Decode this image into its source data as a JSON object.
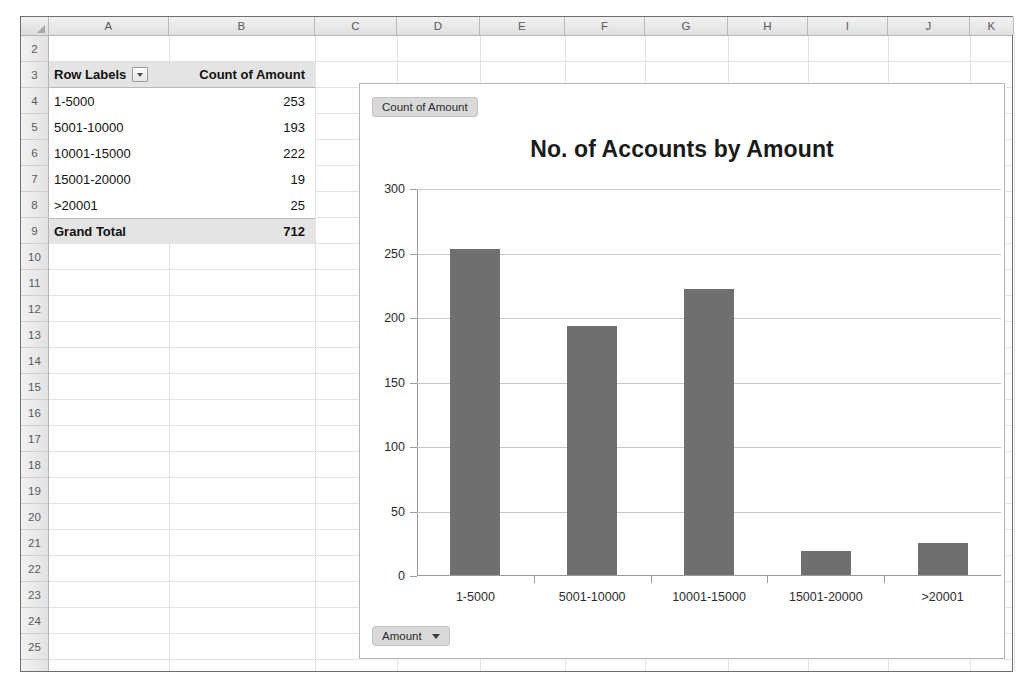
{
  "spreadsheet": {
    "corner_label": "select-all",
    "columns": [
      "A",
      "B",
      "C",
      "D",
      "E",
      "F",
      "G",
      "H",
      "I",
      "J",
      "K"
    ],
    "rows": [
      "2",
      "3",
      "4",
      "5",
      "6",
      "7",
      "8",
      "9",
      "10",
      "11",
      "12",
      "13",
      "14",
      "15",
      "16",
      "17",
      "18",
      "19",
      "20",
      "21",
      "22",
      "23",
      "24",
      "25"
    ],
    "pivot": {
      "header": {
        "row_labels": "Row Labels",
        "value_header": "Count of Amount"
      },
      "rows": [
        {
          "label": "1-5000",
          "count": "253"
        },
        {
          "label": "5001-10000",
          "count": "193"
        },
        {
          "label": "10001-15000",
          "count": "222"
        },
        {
          "label": "15001-20000",
          "count": "19"
        },
        {
          "label": ">20001",
          "count": "25"
        }
      ],
      "total": {
        "label": "Grand Total",
        "count": "712"
      }
    }
  },
  "chart": {
    "legend_field_button": "Count of Amount",
    "axis_field_button": "Amount",
    "bar_color": "#6f6f6f",
    "gridline_color": "#c8c8c8"
  },
  "chart_data": {
    "type": "bar",
    "title": "No. of Accounts by Amount",
    "categories": [
      "1-5000",
      "5001-10000",
      "10001-15000",
      "15001-20000",
      ">20001"
    ],
    "values": [
      253,
      193,
      222,
      19,
      25
    ],
    "series": [
      {
        "name": "Count of Amount",
        "values": [
          253,
          193,
          222,
          19,
          25
        ]
      }
    ],
    "xlabel": "",
    "ylabel": "",
    "ylim": [
      0,
      300
    ],
    "yticks": [
      0,
      50,
      100,
      150,
      200,
      250,
      300
    ],
    "grid": true,
    "legend_position": "none"
  }
}
